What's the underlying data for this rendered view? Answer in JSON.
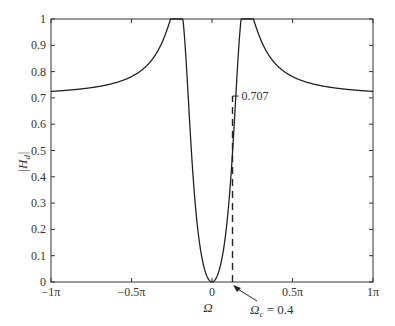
{
  "chart_data": {
    "type": "line",
    "title": "",
    "xlabel": "Ω",
    "ylabel": "|H_d|",
    "xlim": [
      -3.14159,
      3.14159
    ],
    "ylim": [
      0,
      1
    ],
    "grid": false,
    "x_ticks": [
      {
        "value": -3.14159,
        "label": "−1π"
      },
      {
        "value": -1.5708,
        "label": "−0.5π"
      },
      {
        "value": 0,
        "label": "0"
      },
      {
        "value": 1.5708,
        "label": "0.5π"
      },
      {
        "value": 3.14159,
        "label": "1π"
      }
    ],
    "y_ticks": [
      {
        "value": 0,
        "label": "0"
      },
      {
        "value": 0.1,
        "label": "0.1"
      },
      {
        "value": 0.2,
        "label": "0.2"
      },
      {
        "value": 0.3,
        "label": "0.3"
      },
      {
        "value": 0.4,
        "label": "0.4"
      },
      {
        "value": 0.5,
        "label": "0.5"
      },
      {
        "value": 0.6,
        "label": "0.6"
      },
      {
        "value": 0.7,
        "label": "0.7"
      },
      {
        "value": 0.8,
        "label": "0.8"
      },
      {
        "value": 0.9,
        "label": "0.9"
      },
      {
        "value": 1,
        "label": "1"
      }
    ],
    "series": [
      {
        "name": "|H_d|",
        "x": [
          -3.14,
          -2.5,
          -2.0,
          -1.5,
          -1.2,
          -1.0,
          -0.85,
          -0.75,
          -0.65,
          -0.6,
          -0.57,
          -0.5,
          -0.4,
          -0.3,
          -0.2,
          -0.1,
          0,
          0.1,
          0.2,
          0.3,
          0.4,
          0.5,
          0.57,
          0.6,
          0.65,
          0.75,
          0.85,
          1.0,
          1.2,
          1.5,
          2.0,
          2.5,
          3.14
        ],
        "values": [
          0.707,
          0.71,
          0.715,
          0.73,
          0.75,
          0.78,
          0.82,
          0.87,
          0.94,
          0.98,
          1.0,
          0.93,
          0.707,
          0.42,
          0.17,
          0.04,
          0,
          0.04,
          0.17,
          0.42,
          0.707,
          0.93,
          1.0,
          0.98,
          0.94,
          0.87,
          0.82,
          0.78,
          0.75,
          0.73,
          0.715,
          0.71,
          0.707
        ]
      }
    ],
    "annotations": [
      {
        "text": "0.707",
        "x": 0.4,
        "y": 0.707,
        "type": "tick-label"
      },
      {
        "text": "Ω_c = 0.4",
        "x": 0.4,
        "y": 0,
        "type": "arrow-label"
      },
      {
        "type": "dashed-vline",
        "x": 0.4,
        "y_from": 0,
        "y_to": 0.707
      }
    ]
  },
  "labels": {
    "ylabel_main": "|H",
    "ylabel_sub": "d",
    "ylabel_end": "|",
    "xlabel": "Ω",
    "marker_value": "0.707",
    "cutoff_main": "Ω",
    "cutoff_sub": "c",
    "cutoff_eq": " = 0.4"
  }
}
